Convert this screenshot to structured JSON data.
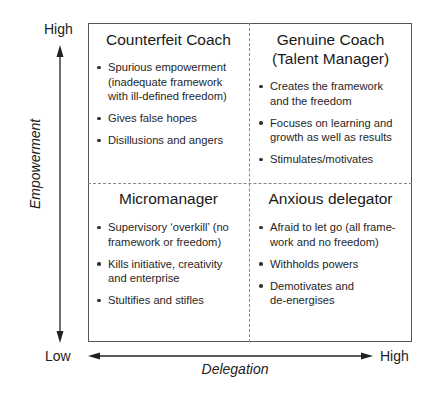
{
  "axes": {
    "y": {
      "title": "Empowerment",
      "high_label": "High",
      "low_label": "Low"
    },
    "x": {
      "title": "Delegation",
      "low_label": "Low",
      "high_label": "High"
    }
  },
  "quadrants": {
    "top_left": {
      "title_lines": [
        "Counterfeit Coach"
      ],
      "bullets": [
        {
          "lines": [
            "Spurious empowerment",
            "(inadequate framework",
            "with ill-defined freedom)"
          ]
        },
        {
          "lines": [
            "Gives false hopes"
          ]
        },
        {
          "lines": [
            "Disillusions and angers"
          ]
        }
      ]
    },
    "top_right": {
      "title_lines": [
        "Genuine Coach",
        "(Talent Manager)"
      ],
      "bullets": [
        {
          "lines": [
            "Creates the framework",
            "and the freedom"
          ]
        },
        {
          "lines": [
            "Focuses on learning and",
            "growth as well as results"
          ]
        },
        {
          "lines": [
            "Stimulates/motivates"
          ]
        }
      ]
    },
    "bottom_left": {
      "title_lines": [
        "Micromanager"
      ],
      "bullets": [
        {
          "lines": [
            "Supervisory ‘overkill’ (no",
            "framework or freedom)"
          ]
        },
        {
          "lines": [
            "Kills initiative, creativity",
            "and enterprise"
          ]
        },
        {
          "lines": [
            "Stultifies and stifles"
          ]
        }
      ]
    },
    "bottom_right": {
      "title_lines": [
        "Anxious delegator"
      ],
      "bullets": [
        {
          "lines": [
            "Afraid to let go (all frame-",
            "work and no freedom)"
          ]
        },
        {
          "lines": [
            "Withholds powers"
          ]
        },
        {
          "lines": [
            "Demotivates and",
            "de-energises"
          ]
        }
      ]
    }
  }
}
